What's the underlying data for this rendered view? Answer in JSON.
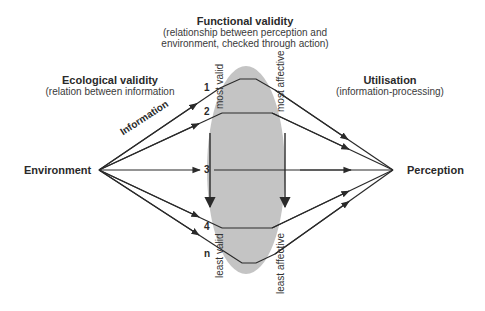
{
  "diagram": {
    "type": "lens-model",
    "nodes": {
      "environment": "Environment",
      "perception": "Perception"
    },
    "headings": {
      "functional_validity": {
        "title": "Functional validity",
        "line1": "(relationship between perception and",
        "line2": "environment, checked through action)"
      },
      "ecological_validity": {
        "title": "Ecological validity",
        "subtitle": "(relation between information"
      },
      "utilisation": {
        "title": "Utilisation",
        "subtitle": "(information-processing)"
      }
    },
    "edge_label": "Information",
    "cues": [
      "1",
      "2",
      "3",
      "4",
      "n"
    ],
    "left_axis": {
      "top": "most valid",
      "bottom": "least valid"
    },
    "right_axis": {
      "top": "most affective",
      "bottom": "least affective"
    },
    "colors": {
      "lens_fill": "#c4c4c4",
      "line": "#2a2a2a",
      "background": "#ffffff"
    }
  }
}
